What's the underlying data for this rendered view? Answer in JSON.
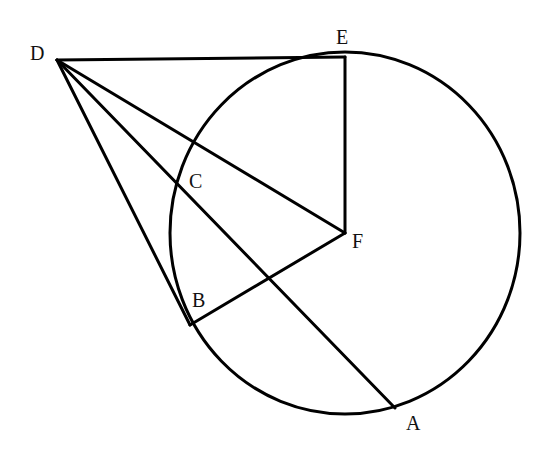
{
  "figure": {
    "type": "geometry",
    "colors": {
      "stroke": "#000000",
      "background": "#ffffff",
      "text": "#111111"
    },
    "circle": {
      "center": "F",
      "cx": 345,
      "cy": 233,
      "rx": 175,
      "ry": 181
    },
    "points": [
      {
        "name": "D",
        "x": 57,
        "y": 60,
        "label": "D",
        "label_x": 30,
        "label_y": 60
      },
      {
        "name": "E",
        "x": 345,
        "y": 57,
        "label": "E",
        "label_x": 336,
        "label_y": 44
      },
      {
        "name": "C",
        "x": 176,
        "y": 181,
        "label": "C",
        "label_x": 189,
        "label_y": 188
      },
      {
        "name": "F",
        "x": 345,
        "y": 233,
        "label": "F",
        "label_x": 352,
        "label_y": 248
      },
      {
        "name": "B",
        "x": 190,
        "y": 325,
        "label": "B",
        "label_x": 192,
        "label_y": 307
      },
      {
        "name": "A",
        "x": 395,
        "y": 408,
        "label": "A",
        "label_x": 406,
        "label_y": 430
      }
    ],
    "segments": [
      {
        "from": "D",
        "to": "E",
        "x1": 57,
        "y1": 60,
        "x2": 345,
        "y2": 57
      },
      {
        "from": "D",
        "to": "F",
        "x1": 57,
        "y1": 60,
        "x2": 345,
        "y2": 233
      },
      {
        "from": "D",
        "to": "A",
        "x1": 57,
        "y1": 60,
        "x2": 395,
        "y2": 408
      },
      {
        "from": "D",
        "to": "B",
        "x1": 57,
        "y1": 60,
        "x2": 190,
        "y2": 325
      },
      {
        "from": "E",
        "to": "F",
        "x1": 345,
        "y1": 57,
        "x2": 345,
        "y2": 233
      },
      {
        "from": "F",
        "to": "B",
        "x1": 345,
        "y1": 233,
        "x2": 190,
        "y2": 325
      }
    ]
  }
}
